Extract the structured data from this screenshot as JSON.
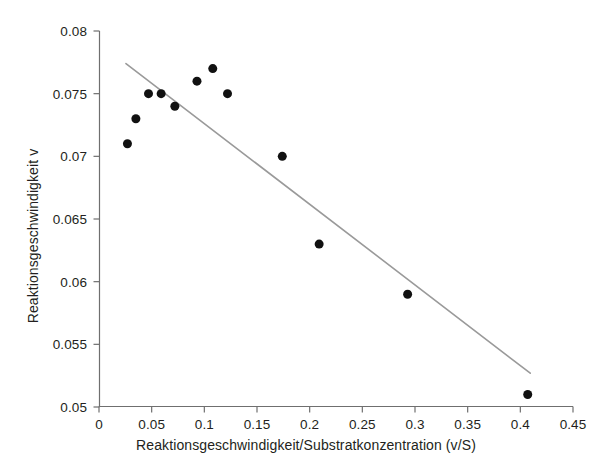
{
  "chart_data": {
    "type": "scatter",
    "title": "",
    "subtitle": "",
    "xlabel": "Reaktionsgeschwindigkeit/Substratkonzentration (v/S)",
    "ylabel": "Reaktionsgeschwindigkeit v",
    "xlim": [
      0,
      0.45
    ],
    "ylim": [
      0.05,
      0.08
    ],
    "xticks": [
      0,
      0.05,
      0.1,
      0.15,
      0.2,
      0.25,
      0.3,
      0.35,
      0.4,
      0.45
    ],
    "xtick_labels": [
      "0",
      "0.05",
      "0.1",
      "0.15",
      "0.2",
      "0.25",
      "0.3",
      "0.35",
      "0.4",
      "0.45"
    ],
    "yticks": [
      0.05,
      0.055,
      0.06,
      0.065,
      0.07,
      0.075,
      0.08
    ],
    "ytick_labels": [
      "0.05",
      "0.055",
      "0.06",
      "0.065",
      "0.07",
      "0.075",
      "0.08"
    ],
    "grid": false,
    "legend": null,
    "legend_position": "none",
    "series": [
      {
        "name": "Messpunkte",
        "type": "scatter",
        "marker": "circle-filled",
        "color": "#111111",
        "marker_size": 9,
        "points": [
          {
            "x": 0.027,
            "y": 0.071
          },
          {
            "x": 0.035,
            "y": 0.073
          },
          {
            "x": 0.047,
            "y": 0.075
          },
          {
            "x": 0.059,
            "y": 0.075
          },
          {
            "x": 0.072,
            "y": 0.074
          },
          {
            "x": 0.093,
            "y": 0.076
          },
          {
            "x": 0.108,
            "y": 0.077
          },
          {
            "x": 0.122,
            "y": 0.075
          },
          {
            "x": 0.174,
            "y": 0.07
          },
          {
            "x": 0.209,
            "y": 0.063
          },
          {
            "x": 0.293,
            "y": 0.059
          },
          {
            "x": 0.407,
            "y": 0.051
          }
        ]
      },
      {
        "name": "Regressionsgerade",
        "type": "line",
        "color": "#9a9a9a",
        "line_width": 1.6,
        "points": [
          {
            "x": 0.0256,
            "y": 0.0774
          },
          {
            "x": 0.4094,
            "y": 0.0527
          }
        ]
      }
    ]
  },
  "figure": {
    "background_color": "#ffffff",
    "axis_color": "#6f6f6f",
    "text_color": "#231f20"
  }
}
